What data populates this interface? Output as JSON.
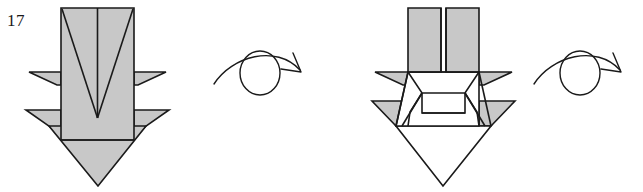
{
  "document": {
    "kind": "origami-folding-diagram",
    "background_color": "#ffffff",
    "line_color": "#1a1a1a",
    "paper_fill": "#c8c8c8",
    "paper_back_fill": "#ffffff",
    "width": 643,
    "height": 192
  },
  "steps": [
    {
      "id": "step-17",
      "number": "17",
      "caption": "",
      "description": "Narrow pointed base seen from the front: tall shaded rectangle with a centre crease and a large V crease, two pairs of side flaps and a broad downward arrow point."
    },
    {
      "id": "step-18",
      "number": "18",
      "caption": "",
      "description": "Reverse side of the model: two shaded rectangles split by a centre gap, white pleated middle band with angular creases, side flaps, and an open white diamond point below."
    }
  ],
  "symbols": [
    {
      "id": "turn-over-1",
      "name": "turn-over-symbol",
      "meaning": "Turn the model over",
      "glyph": "looped-arrow-over-circle"
    },
    {
      "id": "turn-over-2",
      "name": "turn-over-symbol",
      "meaning": "Turn the model over",
      "glyph": "looped-arrow-over-circle"
    }
  ]
}
